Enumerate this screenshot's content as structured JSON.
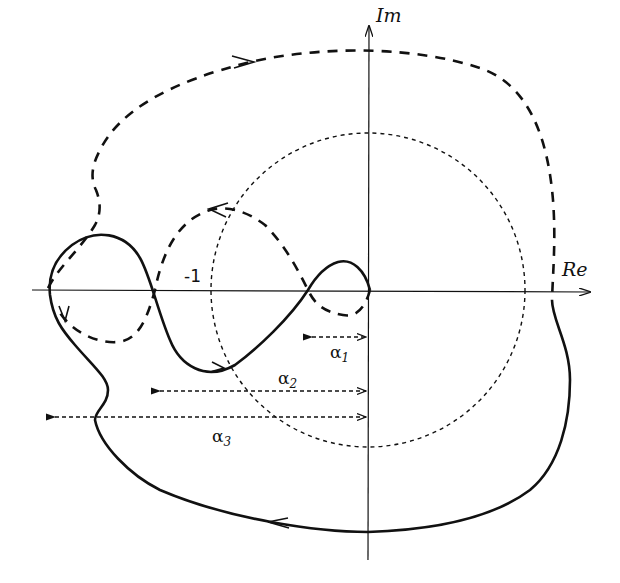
{
  "diagram": {
    "type": "nyquist-plot",
    "axes": {
      "real_label": "Re",
      "imag_label": "Im"
    },
    "critical_point_label": "-1",
    "unit_circle": {
      "style": "dotted",
      "center": "origin",
      "radius": 1
    },
    "curves": [
      {
        "name": "positive-frequency-branch",
        "style": "solid"
      },
      {
        "name": "negative-frequency-branch",
        "style": "dashed"
      }
    ],
    "distances": [
      {
        "label_base": "α",
        "label_sub": "1"
      },
      {
        "label_base": "α",
        "label_sub": "2"
      },
      {
        "label_base": "α",
        "label_sub": "3"
      }
    ],
    "colors": {
      "ink": "#111111",
      "background": "#ffffff"
    }
  }
}
